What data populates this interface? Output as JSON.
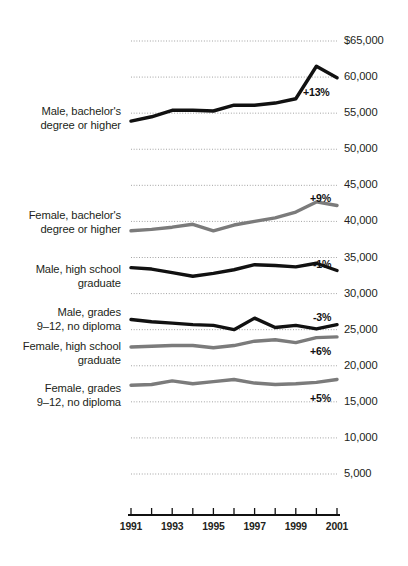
{
  "chart_data": {
    "type": "line",
    "title": "",
    "subtitle": "",
    "xlabel": "",
    "ylabel": "",
    "x": [
      1991,
      1992,
      1993,
      1994,
      1995,
      1996,
      1997,
      1998,
      1999,
      2000,
      2001
    ],
    "xlim": [
      1991,
      2001
    ],
    "ylim": [
      0,
      65000
    ],
    "grid": true,
    "legend_position": "inline-left",
    "y_ticks": [
      65000,
      60000,
      55000,
      50000,
      45000,
      40000,
      35000,
      30000,
      25000,
      20000,
      15000,
      10000,
      5000
    ],
    "y_tick_labels": [
      "$65,000",
      "60,000",
      "55,000",
      "50,000",
      "45,000",
      "40,000",
      "35,000",
      "30,000",
      "25,000",
      "20,000",
      "15,000",
      "10,000",
      "5,000"
    ],
    "x_tick_labels": [
      "1991",
      "1993",
      "1995",
      "1997",
      "1999",
      "2001"
    ],
    "x_tick_years": [
      1991,
      1993,
      1995,
      1997,
      1999,
      2001
    ],
    "series": [
      {
        "name": "Male, bachelor's degree or higher",
        "label_lines": "Male, bachelor's\ndegree or higher",
        "color": "#111111",
        "change": "+13%",
        "values": [
          53900,
          54500,
          55400,
          55400,
          55300,
          56100,
          56100,
          56400,
          57000,
          61500,
          59900
        ]
      },
      {
        "name": "Female, bachelor's degree or higher",
        "label_lines": "Female, bachelor's\ndegree or higher",
        "color": "#7b7b7b",
        "change": "+9%",
        "values": [
          38700,
          38900,
          39200,
          39600,
          38700,
          39500,
          40000,
          40500,
          41300,
          42700,
          42200
        ]
      },
      {
        "name": "Male, high school graduate",
        "label_lines": "Male, high school\ngraduate",
        "color": "#111111",
        "change": "-1%",
        "values": [
          33600,
          33400,
          32900,
          32400,
          32800,
          33300,
          34000,
          33900,
          33700,
          34200,
          33200
        ]
      },
      {
        "name": "Male, grades 9–12, no diploma",
        "label_lines": "Male, grades\n9–12, no diploma",
        "color": "#111111",
        "change": "-3%",
        "values": [
          26400,
          26100,
          25900,
          25700,
          25600,
          25000,
          26600,
          25300,
          25600,
          25100,
          25700
        ]
      },
      {
        "name": "Female, high school graduate",
        "label_lines": "Female, high school\ngraduate",
        "color": "#7b7b7b",
        "change": "+6%",
        "values": [
          22600,
          22700,
          22800,
          22800,
          22500,
          22800,
          23400,
          23600,
          23200,
          23900,
          24000
        ]
      },
      {
        "name": "Female, grades 9–12, no diploma",
        "label_lines": "Female, grades\n9–12, no diploma",
        "color": "#7b7b7b",
        "change": "+5%",
        "values": [
          17300,
          17400,
          17900,
          17500,
          17800,
          18100,
          17600,
          17400,
          17500,
          17700,
          18100
        ]
      }
    ]
  },
  "colors": {
    "dark_series": "#111111",
    "gray_series": "#7b7b7b",
    "gridline": "#8d8d8d",
    "axis": "#111111",
    "text": "#231f20"
  }
}
